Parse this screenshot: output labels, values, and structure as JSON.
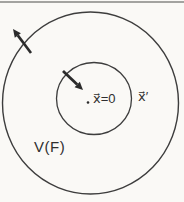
{
  "diagram": {
    "labels": {
      "center": "x⃗=0",
      "point": "x⃗′",
      "region": "V(F)"
    },
    "colors": {
      "background": "#faf9f6",
      "line": "#3d3d3d",
      "arrow": "#2b2b2b",
      "text": "#2f2f2f",
      "top_rule": "#a3a3a0"
    }
  }
}
